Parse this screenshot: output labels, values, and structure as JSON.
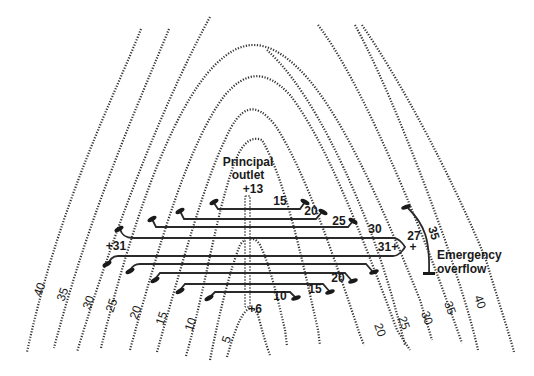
{
  "diagram": {
    "type": "contour map with terrace pipe outlet layout",
    "labels": {
      "principal_outlet_line1": "Principal",
      "principal_outlet_line2": "outlet",
      "riser_top_elevation": "+13",
      "riser_bottom_elevation": "+6",
      "left_spot_elevation": "+31",
      "right_spot_elevation": "31+",
      "spot_27": "27",
      "spot_27_mark": "+",
      "emergency_line1": "Emergency",
      "emergency_line2": "overflow",
      "emergency_contour": "35"
    },
    "pipe_labels": {
      "upper": [
        "15",
        "20",
        "25",
        "30"
      ],
      "lower": [
        "20",
        "15",
        "10"
      ]
    },
    "contour_labels_left": [
      "40",
      "35",
      "30",
      "25",
      "20",
      "15",
      "10",
      "5"
    ],
    "contour_labels_right": [
      "20",
      "25",
      "30",
      "35",
      "40"
    ],
    "contour_interval": 5,
    "colors": {
      "line": "#333333",
      "background": "#ffffff"
    }
  }
}
